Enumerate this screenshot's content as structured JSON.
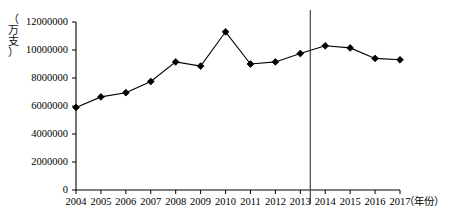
{
  "chart_data": {
    "type": "line",
    "title": "",
    "xlabel": "（年份）",
    "ylabel": "（万支）",
    "x": [
      2004,
      2005,
      2006,
      2007,
      2008,
      2009,
      2010,
      2011,
      2012,
      2013,
      2014,
      2015,
      2016,
      2017
    ],
    "categories": [
      "2004",
      "2005",
      "2006",
      "2007",
      "2008",
      "2009",
      "2010",
      "2011",
      "2012",
      "2013",
      "2014",
      "2015",
      "2016",
      "2017"
    ],
    "values": [
      5900000,
      6650000,
      6950000,
      7750000,
      9150000,
      8850000,
      11300000,
      9000000,
      9150000,
      9750000,
      10300000,
      10150000,
      9400000,
      9300000
    ],
    "series": [
      {
        "name": "产量",
        "values": [
          5900000,
          6650000,
          6950000,
          7750000,
          9150000,
          8850000,
          11300000,
          9000000,
          9150000,
          9750000,
          10300000,
          10150000,
          9400000,
          9300000
        ]
      }
    ],
    "ylim": [
      0,
      12000000
    ],
    "xlim": [
      2004,
      2017
    ],
    "ytick_labels": [
      "0",
      "2000000",
      "4000000",
      "6000000",
      "8000000",
      "10000000",
      "12000000"
    ],
    "ytick_values": [
      0,
      2000000,
      4000000,
      6000000,
      8000000,
      10000000,
      12000000
    ],
    "grid": false,
    "legend": null,
    "marker": "diamond",
    "line_color": "#000000",
    "marker_color": "#000000",
    "annotations": [
      {
        "type": "vertical-reference-line",
        "x": 2013.4,
        "label": "",
        "color": "#444444"
      }
    ]
  },
  "ylabel_chars": [
    "（",
    "万",
    "支",
    "）"
  ]
}
